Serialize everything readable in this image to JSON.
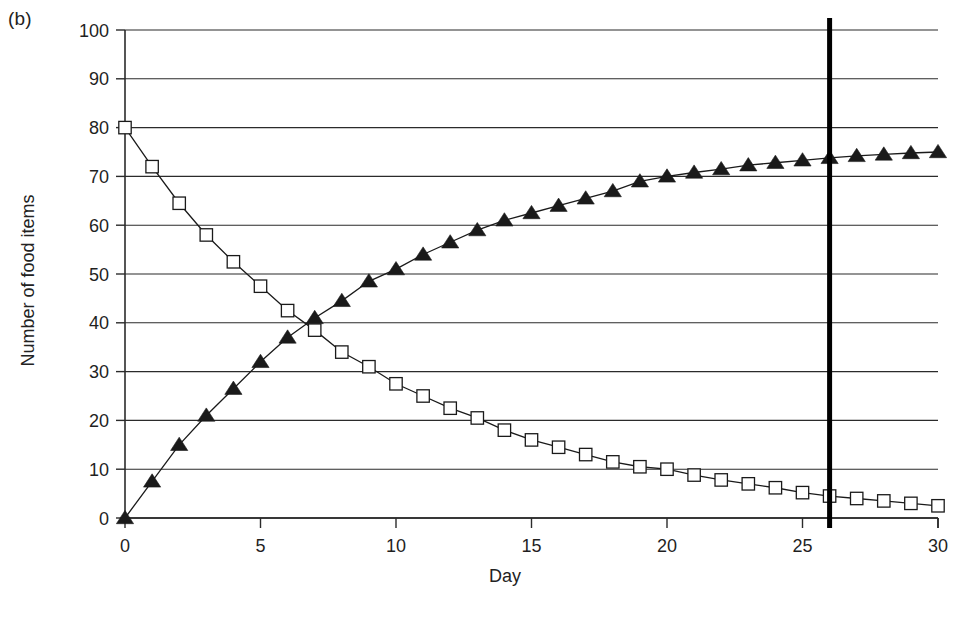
{
  "panel": {
    "label": "(b)"
  },
  "chart_data": {
    "type": "line",
    "title": "",
    "subtitle": "",
    "xlabel": "Day",
    "ylabel": "Number of food items",
    "xlim": [
      0,
      30
    ],
    "ylim": [
      0,
      100
    ],
    "xticks": [
      0,
      5,
      10,
      15,
      20,
      25,
      30
    ],
    "xtick_labels": [
      "0",
      "5",
      "10",
      "15",
      "20",
      "25",
      "30"
    ],
    "yticks": [
      0,
      10,
      20,
      30,
      40,
      50,
      60,
      70,
      80,
      90,
      100
    ],
    "ytick_labels": [
      "0",
      "10",
      "20",
      "30",
      "40",
      "50",
      "60",
      "70",
      "80",
      "90",
      "100"
    ],
    "grid": "horizontal",
    "legend": "none",
    "x": [
      0,
      1,
      2,
      3,
      4,
      5,
      6,
      7,
      8,
      9,
      10,
      11,
      12,
      13,
      14,
      15,
      16,
      17,
      18,
      19,
      20,
      21,
      22,
      23,
      24,
      25,
      26,
      27,
      28,
      29,
      30
    ],
    "series": [
      {
        "name": "Food items remaining",
        "marker": "open-square",
        "color": "#1a1a1a",
        "values": [
          80,
          72,
          64.5,
          58,
          52.5,
          47.5,
          42.5,
          38.5,
          34,
          31,
          27.5,
          25,
          22.5,
          20.5,
          18,
          16,
          14.5,
          13,
          11.5,
          10.5,
          10,
          8.8,
          7.8,
          7,
          6.2,
          5.2,
          4.5,
          4,
          3.5,
          3,
          2.5
        ]
      },
      {
        "name": "Food items consumed",
        "marker": "filled-triangle",
        "color": "#1a1a1a",
        "values": [
          0,
          7.5,
          15,
          21,
          26.5,
          32,
          37,
          41,
          44.5,
          48.5,
          51,
          54,
          56.5,
          59,
          61,
          62.5,
          64,
          65.5,
          67,
          69,
          70,
          70.8,
          71.5,
          72.3,
          72.8,
          73.3,
          73.8,
          74.2,
          74.5,
          74.8,
          75
        ]
      }
    ],
    "annotations": [
      {
        "name": "vertical-marker",
        "type": "vline",
        "x": 26,
        "color": "#000000",
        "width_px": 5
      }
    ]
  }
}
